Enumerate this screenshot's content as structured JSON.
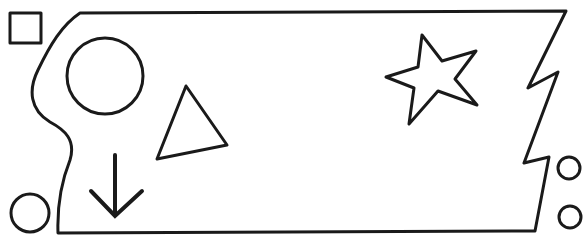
{
  "diagram": {
    "title": "Shapes diagram",
    "stroke_color": "#1a1a1a",
    "background": "#ffffff",
    "shapes": [
      {
        "name": "square",
        "label": "Square (outside, top-left)"
      },
      {
        "name": "main-outline",
        "label": "Irregular outlined region with curved left edge and zigzag right edge"
      },
      {
        "name": "large-circle",
        "label": "Circle (inside)"
      },
      {
        "name": "triangle",
        "label": "Triangle (inside)"
      },
      {
        "name": "star",
        "label": "Five-pointed star (inside)"
      },
      {
        "name": "down-arrow",
        "label": "Down arrow (inside)"
      },
      {
        "name": "small-circle-bottom-left",
        "label": "Circle (outside, bottom-left)"
      },
      {
        "name": "small-circle-right-upper",
        "label": "Small circle (outside, right)"
      },
      {
        "name": "small-circle-right-lower",
        "label": "Small circle (outside, right)"
      }
    ]
  }
}
